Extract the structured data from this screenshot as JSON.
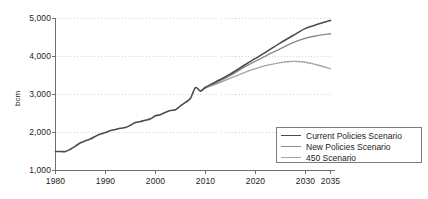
{
  "chart_data": {
    "type": "line",
    "title": "",
    "xlabel": "",
    "ylabel": "bcm",
    "xlim": [
      1980,
      2035
    ],
    "ylim": [
      1000,
      5000
    ],
    "grid": true,
    "legend_position": "bottom-right",
    "x_ticks": [
      "1980",
      "1990",
      "2000",
      "2010",
      "2020",
      "2030",
      "2035"
    ],
    "x_tick_values": [
      1980,
      1990,
      2000,
      2010,
      2020,
      2030,
      2035
    ],
    "y_ticks": [
      "1,000",
      "2,000",
      "3,000",
      "4,000",
      "5,000"
    ],
    "y_tick_values": [
      1000,
      2000,
      3000,
      4000,
      5000
    ],
    "series": [
      {
        "name": "Current Policies Scenario",
        "color": "#4c4c4c",
        "width": 1.6,
        "x": [
          1980,
          1981,
          1982,
          1983,
          1984,
          1985,
          1986,
          1987,
          1988,
          1989,
          1990,
          1991,
          1992,
          1993,
          1994,
          1995,
          1996,
          1997,
          1998,
          1999,
          2000,
          2001,
          2002,
          2003,
          2004,
          2005,
          2006,
          2007,
          2008,
          2009,
          2010,
          2012,
          2015,
          2018,
          2020,
          2022,
          2025,
          2028,
          2030,
          2032,
          2035
        ],
        "values": [
          1500,
          1500,
          1500,
          1560,
          1640,
          1730,
          1780,
          1830,
          1900,
          1960,
          2000,
          2050,
          2080,
          2110,
          2130,
          2190,
          2260,
          2290,
          2320,
          2360,
          2440,
          2470,
          2530,
          2580,
          2600,
          2700,
          2790,
          2900,
          3180,
          3090,
          3190,
          3330,
          3540,
          3790,
          3950,
          4110,
          4360,
          4590,
          4740,
          4830,
          4950
        ]
      },
      {
        "name": "New Policies Scenario",
        "color": "#8c8c8c",
        "width": 1.4,
        "x": [
          2009,
          2010,
          2012,
          2015,
          2018,
          2020,
          2022,
          2025,
          2028,
          2030,
          2032,
          2035
        ],
        "values": [
          3090,
          3180,
          3300,
          3500,
          3740,
          3880,
          4010,
          4210,
          4390,
          4480,
          4540,
          4600
        ]
      },
      {
        "name": "450 Scenario",
        "color": "#a6a6a6",
        "width": 1.4,
        "x": [
          2009,
          2010,
          2012,
          2015,
          2018,
          2020,
          2022,
          2025,
          2027,
          2028,
          2030,
          2032,
          2035
        ],
        "values": [
          3090,
          3170,
          3270,
          3430,
          3590,
          3680,
          3760,
          3840,
          3870,
          3870,
          3850,
          3790,
          3680
        ]
      }
    ]
  }
}
